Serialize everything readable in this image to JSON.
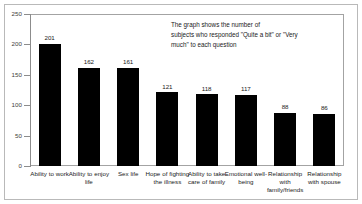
{
  "chart_data": {
    "type": "bar",
    "title": "",
    "xlabel": "",
    "ylabel": "",
    "ylim": [
      0,
      250
    ],
    "yticks": [
      0,
      50,
      100,
      150,
      200,
      250
    ],
    "ytick_labels": [
      "0",
      "50",
      "100",
      "150",
      "200",
      "250"
    ],
    "grid": false,
    "legend": null,
    "bar_color": "#000000",
    "categories": [
      "Ability to work",
      "Ability to enjoy life",
      "Sex life",
      "Hope of fighting the illness",
      "Ability to take care of family",
      "Emotional well-being",
      "Relationship with family/friends",
      "Relationship with spouse"
    ],
    "values": [
      201,
      162,
      161,
      121,
      118,
      117,
      88,
      86
    ],
    "data_labels": [
      "201",
      "162",
      "161",
      "121",
      "118",
      "117",
      "88",
      "86"
    ],
    "annotations": [
      {
        "text": "The graph shows the number of\nsubjects who responded \"Quite a bit\" or \"Very\nmuch\" to each question"
      }
    ]
  }
}
